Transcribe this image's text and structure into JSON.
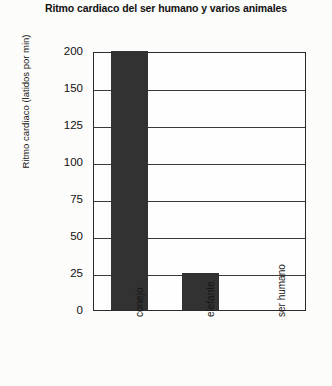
{
  "chart_data": {
    "type": "bar",
    "title": "Ritmo cardiaco del ser humano y varios animales",
    "xlabel": "",
    "ylabel": "Ritmo cardiaco (latidos por min)",
    "categories": [
      "conejo",
      "elefante",
      "ser humano"
    ],
    "values": [
      200,
      25,
      null
    ],
    "yticks": [
      0,
      25,
      50,
      75,
      100,
      125,
      150,
      200
    ],
    "ylim": [
      0,
      200
    ],
    "grid": true,
    "legend": false,
    "series": [
      {
        "name": "Ritmo cardiaco",
        "values": [
          200,
          25,
          null
        ]
      }
    ]
  },
  "style": {
    "bar_color": "#323232",
    "axis_color": "#2b2b2b",
    "grid_color": "#3a3a3a",
    "background": "#fcfcfa",
    "text_color": "#111111"
  }
}
